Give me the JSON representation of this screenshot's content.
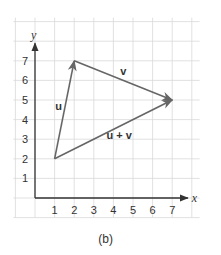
{
  "figure": {
    "caption": "(b)",
    "x_axis_label": "x",
    "y_axis_label": "y",
    "x_ticks": [
      "1",
      "2",
      "3",
      "4",
      "5",
      "6",
      "7"
    ],
    "y_ticks": [
      "1",
      "2",
      "3",
      "4",
      "5",
      "6",
      "7"
    ],
    "grid_range": {
      "x": [
        -1,
        8
      ],
      "y": [
        -1,
        9
      ]
    },
    "colors": {
      "grid": "#d9d9d9",
      "axis": "#333333",
      "vector": "#666666"
    },
    "vectors": [
      {
        "name": "u",
        "label": "u",
        "from": [
          1,
          2
        ],
        "to": [
          2,
          7
        ]
      },
      {
        "name": "v",
        "label": "v",
        "from": [
          2,
          7
        ],
        "to": [
          7,
          5
        ]
      },
      {
        "name": "u-plus-v",
        "label": "u + v",
        "from": [
          1,
          2
        ],
        "to": [
          7,
          5
        ]
      }
    ]
  }
}
